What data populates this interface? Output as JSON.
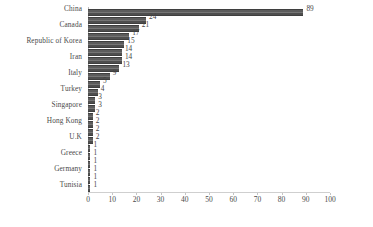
{
  "chart_data": {
    "type": "bar",
    "orientation": "horizontal",
    "title": "",
    "subtitle": "",
    "xlabel": "",
    "ylabel": "",
    "xlim": [
      0,
      100
    ],
    "xticks": [
      0,
      10,
      20,
      30,
      40,
      50,
      60,
      70,
      80,
      90,
      100
    ],
    "grid": false,
    "legend": null,
    "show_value_labels": true,
    "categories": [
      "China",
      "",
      "Canada",
      "",
      "Republic of Korea",
      "",
      "Iran",
      "",
      "Italy",
      "",
      "Turkey",
      "",
      "Singapore",
      "",
      "Hong Kong",
      "",
      "U.K",
      "",
      "Greece",
      "",
      "Germany",
      "",
      "Tunisia"
    ],
    "values": [
      89,
      24,
      21,
      17,
      15,
      14,
      14,
      13,
      9,
      5,
      4,
      3,
      3,
      2,
      2,
      2,
      2,
      1,
      1,
      1,
      1,
      1,
      1
    ],
    "bar_color": "#5c5c5c",
    "background_color": "#ffffff"
  },
  "axis": {
    "tick_labels": [
      "0",
      "10",
      "20",
      "30",
      "40",
      "50",
      "60",
      "70",
      "80",
      "90",
      "100"
    ]
  }
}
